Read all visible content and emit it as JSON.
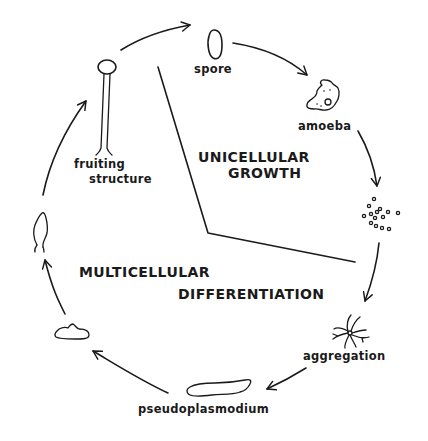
{
  "diagram": {
    "type": "life-cycle",
    "colors": {
      "ink": "#1a1a1a",
      "background": "#ffffff"
    },
    "stages": [
      {
        "id": "spore",
        "label": "spore"
      },
      {
        "id": "amoeba",
        "label": "amoeba"
      },
      {
        "id": "amoeba-cluster",
        "label": ""
      },
      {
        "id": "aggregation",
        "label": "aggregation"
      },
      {
        "id": "pseudoplasmodium",
        "label": "pseudoplasmodium"
      },
      {
        "id": "culmination-mound",
        "label": ""
      },
      {
        "id": "culmination-rising",
        "label": ""
      },
      {
        "id": "fruiting-structure",
        "label_line1": "fruiting",
        "label_line2": "structure"
      }
    ],
    "phases": {
      "unicellular": {
        "line1": "UNICELLULAR",
        "line2": "GROWTH"
      },
      "multicellular": {
        "line1": "MULTICELLULAR",
        "line2": "DIFFERENTIATION"
      }
    },
    "flow_order": [
      "fruiting-structure",
      "spore",
      "amoeba",
      "amoeba-cluster",
      "aggregation",
      "pseudoplasmodium",
      "culmination-mound",
      "culmination-rising",
      "fruiting-structure"
    ]
  }
}
